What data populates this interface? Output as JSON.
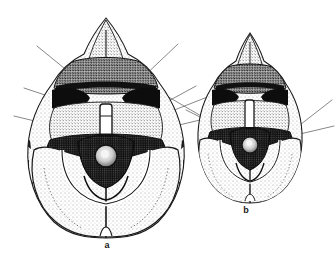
{
  "figure": {
    "kind": "scientific-illustration",
    "technique": "stippled ink drawing",
    "background_color": "#ffffff",
    "ink_color": "#1a1a1a",
    "panels": [
      {
        "id": "a",
        "label": "a",
        "label_x": 107,
        "label_y": 246,
        "relative_size": "larger",
        "leader_line_count": 6
      },
      {
        "id": "b",
        "label": "b",
        "label_x": 246,
        "label_y": 211,
        "relative_size": "smaller",
        "leader_line_count": 3
      }
    ]
  }
}
